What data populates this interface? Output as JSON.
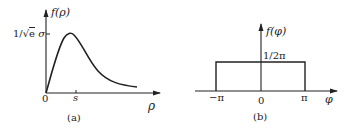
{
  "panels": [
    {
      "id": "a",
      "caption": "(a)",
      "y_axis_label": "f(ρ)",
      "x_axis_label": "ρ",
      "origin_label": "0",
      "x_tick_label": "s",
      "y_tick_label": "1/√e σ",
      "curve": "Rayleigh-type density: rises from 0, peaks at ρ = s with value 1/√e σ, decays toward 0"
    },
    {
      "id": "b",
      "caption": "(b)",
      "y_axis_label": "f(φ)",
      "x_axis_label": "φ",
      "origin_label": "0",
      "x_tick_labels": [
        "−π",
        "π"
      ],
      "level_label": "1/2π",
      "curve": "Uniform density of height 1/2π on [−π, π]"
    }
  ],
  "colors": {
    "stroke": "#222222",
    "background": "#ffffff"
  }
}
